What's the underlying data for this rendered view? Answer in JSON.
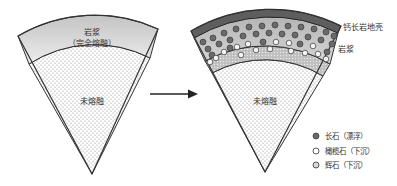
{
  "left_sector": {
    "magma_label": "岩浆",
    "magma_sublabel": "（完全熔融）",
    "core_label": "未熔融"
  },
  "right_sector": {
    "crust_label": "钙长岩地壳",
    "magma_label": "岩浆",
    "core_label": "未熔融"
  },
  "arrow": {
    "direction": "right"
  },
  "legend": {
    "items": [
      {
        "label": "长石（漂浮）",
        "symbol": "filled-dark-circle",
        "color": "#6a6a6a"
      },
      {
        "label": "橄榄石（下沉）",
        "symbol": "open-circle",
        "color": "#ffffff"
      },
      {
        "label": "辉石（下沉）",
        "symbol": "open-circle-gray",
        "color": "#d8d8d8"
      }
    ]
  },
  "colors": {
    "magma_light": "#e6e6e6",
    "magma_dark": "#bdbdbd",
    "crust": "#6b6b6b",
    "band": "#c9c9c9",
    "outline": "#333333"
  }
}
